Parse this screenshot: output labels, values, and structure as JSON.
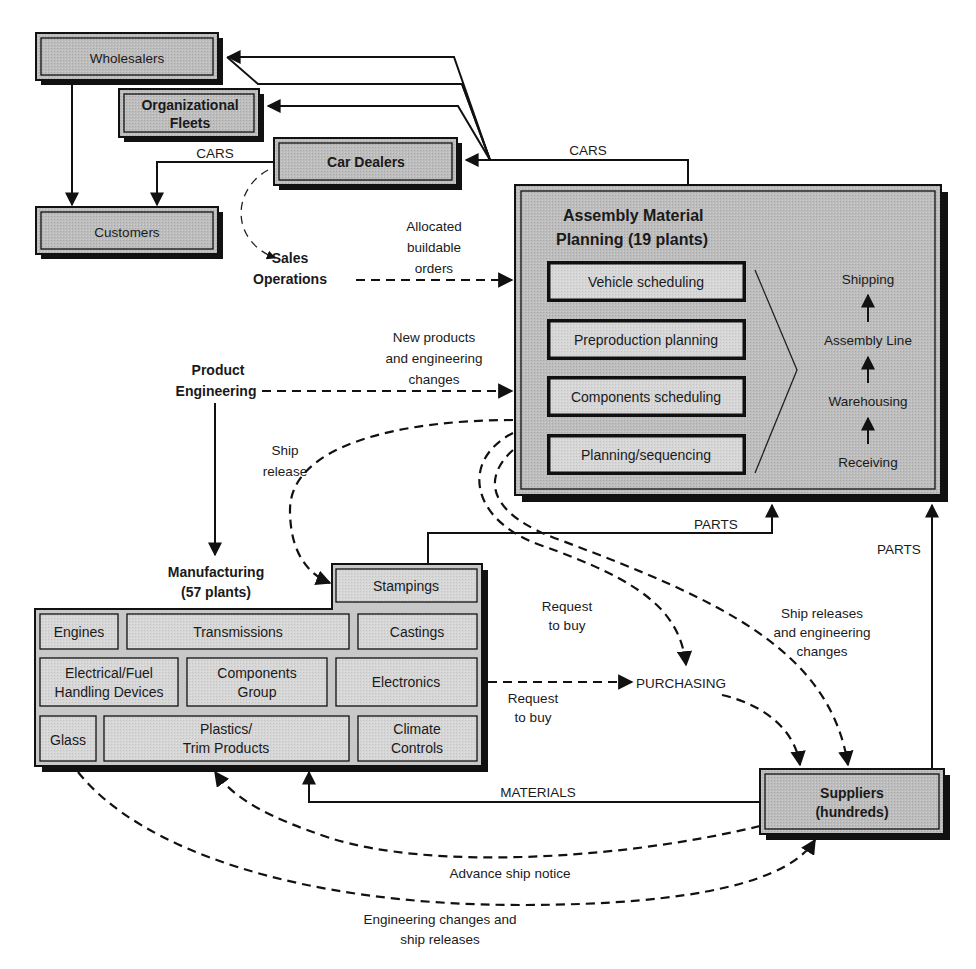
{
  "colors": {
    "box_fill": "#b9b9b9",
    "box_inner": "#c6c6c6",
    "sub_fill": "#d9d9d9",
    "shadow": "#111111",
    "line": "#111111"
  },
  "nodes": {
    "wholesalers": "Wholesalers",
    "org_fleets": [
      "Organizational",
      "Fleets"
    ],
    "car_dealers": "Car Dealers",
    "customers": "Customers",
    "sales_ops": [
      "Sales",
      "Operations"
    ],
    "product_eng": [
      "Product",
      "Engineering"
    ],
    "assembly": {
      "title": [
        "Assembly Material",
        "Planning (19 plants)"
      ],
      "subs": [
        "Vehicle scheduling",
        "Preproduction planning",
        "Components scheduling",
        "Planning/sequencing"
      ],
      "stages": [
        "Shipping",
        "Assembly Line",
        "Warehousing",
        "Receiving"
      ]
    },
    "manufacturing": {
      "title": [
        "Manufacturing",
        "(57 plants)"
      ],
      "stampings": "Stampings",
      "row1": [
        "Engines",
        "Transmissions",
        "Castings"
      ],
      "row2": [
        [
          "Electrical/Fuel",
          "Handling Devices"
        ],
        [
          "Components",
          "Group"
        ],
        [
          "Electronics"
        ]
      ],
      "row3": [
        [
          "Glass"
        ],
        [
          "Plastics/",
          "Trim Products"
        ],
        [
          "Climate",
          "Controls"
        ]
      ]
    },
    "purchasing": "PURCHASING",
    "suppliers": [
      "Suppliers",
      "(hundreds)"
    ]
  },
  "edge_labels": {
    "cars_left": "CARS",
    "cars_top": "CARS",
    "allocated": [
      "Allocated",
      "buildable",
      "orders"
    ],
    "new_products": [
      "New products",
      "and engineering",
      "changes"
    ],
    "ship_release": [
      "Ship",
      "release"
    ],
    "parts_mid": "PARTS",
    "parts_right": "PARTS",
    "request_upper": [
      "Request",
      "to buy"
    ],
    "request_lower": [
      "Request",
      "to buy"
    ],
    "ship_releases_eng": [
      "Ship releases",
      "and engineering",
      "changes"
    ],
    "materials": "MATERIALS",
    "advance_ship": "Advance ship notice",
    "eng_changes": [
      "Engineering changes and",
      "ship releases"
    ]
  }
}
